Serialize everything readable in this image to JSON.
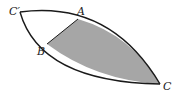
{
  "diagram": {
    "labels": {
      "c_prime": "C′",
      "a": "A",
      "b": "B",
      "c": "C"
    },
    "colors": {
      "shade": "#a6a6a6",
      "stroke": "#1a1a1a",
      "background": "#ffffff"
    }
  }
}
